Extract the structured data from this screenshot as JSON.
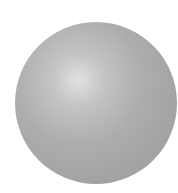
{
  "image": {
    "subject": "shaded gray sphere",
    "background_color": "#ffffff",
    "sphere_colors": {
      "highlight": "#e2e2e2",
      "mid": "#adadad",
      "edge": "#999999"
    }
  }
}
